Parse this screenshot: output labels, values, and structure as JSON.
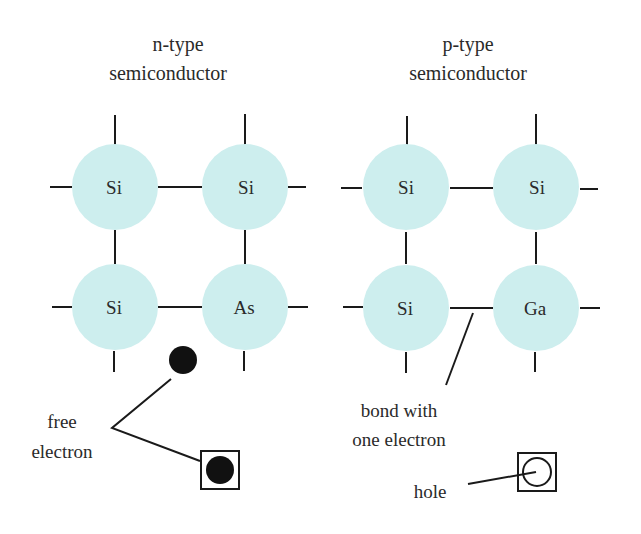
{
  "colors": {
    "atom_fill": "#cdeeee",
    "line": "#1a1a1a",
    "text": "#2a2a2a"
  },
  "n_type": {
    "title_line1": "n-type",
    "title_line2": "semiconductor",
    "atoms": [
      "Si",
      "Si",
      "Si",
      "As"
    ],
    "free_electron_label_line1": "free",
    "free_electron_label_line2": "electron"
  },
  "p_type": {
    "title_line1": "p-type",
    "title_line2": "semiconductor",
    "atoms": [
      "Si",
      "Si",
      "Si",
      "Ga"
    ],
    "bond_label_line1": "bond with",
    "bond_label_line2": "one electron",
    "hole_label": "hole"
  }
}
